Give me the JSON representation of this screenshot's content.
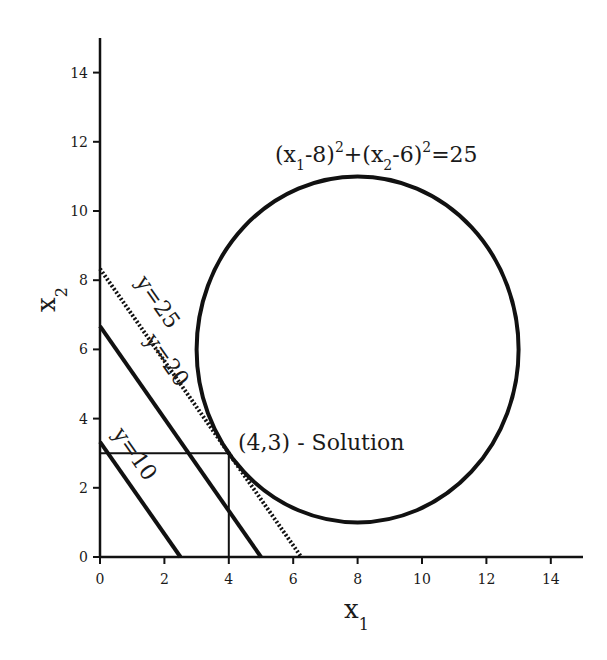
{
  "chart_data": {
    "type": "line",
    "title": "",
    "xlabel": "x",
    "xlabel_sub": "1",
    "ylabel": "x",
    "ylabel_sub": "2",
    "xlim": [
      0,
      15
    ],
    "ylim": [
      0,
      15
    ],
    "xticks": [
      0,
      2,
      4,
      6,
      8,
      10,
      12,
      14
    ],
    "yticks": [
      0,
      2,
      4,
      6,
      8,
      10,
      12,
      14
    ],
    "grid": false,
    "series": [
      {
        "name": "y=10",
        "style": "solid",
        "points": [
          [
            0,
            3.33
          ],
          [
            2.5,
            0
          ]
        ]
      },
      {
        "name": "y=20",
        "style": "solid",
        "points": [
          [
            0,
            6.67
          ],
          [
            5,
            0
          ]
        ]
      },
      {
        "name": "y=25",
        "style": "dotted",
        "points": [
          [
            0,
            8.33
          ],
          [
            6.25,
            0
          ]
        ]
      }
    ],
    "circle": {
      "center": [
        8,
        6
      ],
      "radius": 5,
      "label": "(x1-8)^2+(x2-6)^2=25"
    },
    "solution": {
      "point": [
        4,
        3
      ],
      "label": "(4,3) - Solution"
    },
    "annotations": [
      {
        "text": "y=10"
      },
      {
        "text": "y=20"
      },
      {
        "text": "y=25"
      }
    ]
  },
  "labels": {
    "circle_eq": {
      "p1": "(x",
      "s1": "1",
      "p2": "-8)",
      "e1": "2",
      "p3": "+(x",
      "s2": "2",
      "p4": "-6)",
      "e2": "2",
      "p5": "=25"
    },
    "solution": "(4,3) - Solution",
    "line10": "y=10",
    "line20": "y=20",
    "line25": "y=25",
    "xaxis": "x",
    "xaxis_sub": "1",
    "yaxis": "x",
    "yaxis_sub": "2"
  },
  "colors": {
    "ink": "#111111",
    "background": "#ffffff"
  }
}
